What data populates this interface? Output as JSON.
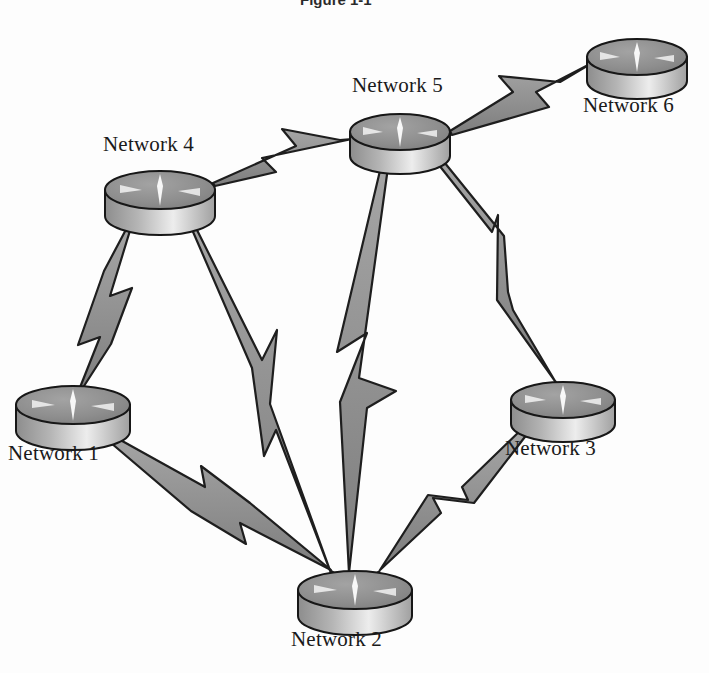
{
  "figure": {
    "kind": "network-topology-diagram",
    "title_fragment": "Figure 1-1",
    "background_color": "#fdfdfd",
    "label_color": "#1a1a1a"
  },
  "style": {
    "router_top_fill": "#8e8e8e",
    "router_top_stroke": "#171717",
    "router_side_light": "#f2f2f2",
    "router_side_dark": "#8a8a8a",
    "router_marking_color": "#ffffff",
    "link_fill": "#8a8a8a",
    "link_stroke": "#232323",
    "bolt_fill": "#959595",
    "bolt_stroke": "#1e1e1e"
  },
  "nodes": [
    {
      "id": "net1",
      "label": "Network 1",
      "cx": 73,
      "cy": 405,
      "rx": 57,
      "ry": 19,
      "depth": 26,
      "label_x": 8,
      "label_y": 441
    },
    {
      "id": "net2",
      "label": "Network 2",
      "cx": 355,
      "cy": 590,
      "rx": 57,
      "ry": 19,
      "depth": 26,
      "label_x": 291,
      "label_y": 627
    },
    {
      "id": "net3",
      "label": "Network 3",
      "cx": 563,
      "cy": 400,
      "rx": 52,
      "ry": 18,
      "depth": 24,
      "label_x": 505,
      "label_y": 436
    },
    {
      "id": "net4",
      "label": "Network 4",
      "cx": 160,
      "cy": 190,
      "rx": 55,
      "ry": 19,
      "depth": 26,
      "label_x": 103,
      "label_y": 132
    },
    {
      "id": "net5",
      "label": "Network 5",
      "cx": 400,
      "cy": 132,
      "rx": 50,
      "ry": 18,
      "depth": 24,
      "label_x": 352,
      "label_y": 73
    },
    {
      "id": "net6",
      "label": "Network 6",
      "cx": 637,
      "cy": 57,
      "rx": 50,
      "ry": 18,
      "depth": 24,
      "label_x": 583,
      "label_y": 93
    }
  ],
  "links": [
    {
      "id": "l-4-5",
      "from": "net4",
      "to": "net5",
      "type": "wan-lightning-link"
    },
    {
      "id": "l-5-6",
      "from": "net5",
      "to": "net6",
      "type": "wan-lightning-link"
    },
    {
      "id": "l-1-4",
      "from": "net1",
      "to": "net4",
      "type": "wan-lightning-link"
    },
    {
      "id": "l-4-2",
      "from": "net4",
      "to": "net2",
      "type": "wan-lightning-link"
    },
    {
      "id": "l-5-2",
      "from": "net5",
      "to": "net2",
      "type": "wan-lightning-link"
    },
    {
      "id": "l-5-3",
      "from": "net5",
      "to": "net3",
      "type": "wan-lightning-link"
    },
    {
      "id": "l-1-2",
      "from": "net1",
      "to": "net2",
      "type": "wan-lightning-link"
    },
    {
      "id": "l-3-2",
      "from": "net3",
      "to": "net2",
      "type": "wan-lightning-link"
    }
  ]
}
